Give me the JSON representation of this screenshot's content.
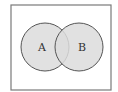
{
  "diagram": {
    "type": "venn",
    "universe": {
      "x": 11,
      "y": 5,
      "width": 100,
      "height": 85,
      "stroke": "#7a7a7a"
    },
    "sets": [
      {
        "label": "A",
        "cx": 45,
        "cy": 47,
        "r": 24,
        "fill": "#dcdcdc",
        "stroke": "#555555"
      },
      {
        "label": "B",
        "cx": 79,
        "cy": 47,
        "r": 24,
        "fill": "#dcdcdc",
        "stroke": "#555555"
      }
    ]
  }
}
